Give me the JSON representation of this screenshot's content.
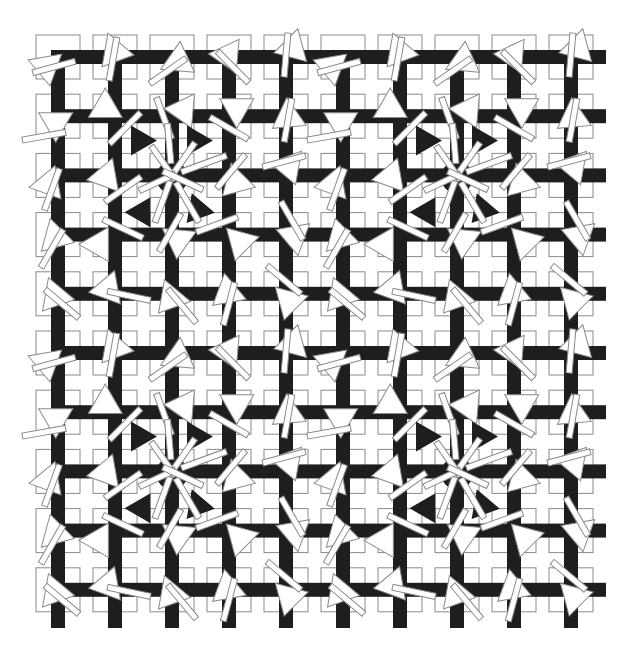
{
  "artwork": {
    "background": "#ffffff",
    "ink": "#1e1e1e",
    "outline": "#8a8a8a",
    "grid": {
      "cols": 10,
      "rows": 10,
      "origin_x": 36,
      "origin_y": 35,
      "pitch_x": 57,
      "pitch_y": 59.2,
      "square_size": 44,
      "bar_width": 14,
      "stub_right_to": 606,
      "stub_bottom_to": 628
    },
    "tile_period": 5,
    "tile": [
      [
        {
          "tri": 200,
          "tdx": -16,
          "tdy": 8,
          "bar": -15,
          "bdx": -4,
          "bdy": 10,
          "circle": false
        },
        {
          "tri": 250,
          "tdx": -2,
          "tdy": -10,
          "bar": -80,
          "bdx": -2,
          "bdy": 2,
          "circle": false
        },
        {
          "tri": 155,
          "tdx": 2,
          "tdy": 6,
          "bar": -35,
          "bdx": -4,
          "bdy": 14,
          "circle": false
        },
        {
          "tri": 185,
          "tdx": -6,
          "tdy": -2,
          "bar": 45,
          "bdx": 4,
          "bdy": 10,
          "circle": false
        },
        {
          "tri": 285,
          "tdx": 8,
          "tdy": -14,
          "bar": -85,
          "bdx": 0,
          "bdy": -2,
          "circle": false
        }
      ],
      [
        {
          "tri": 330,
          "tdx": 2,
          "tdy": 4,
          "bar": -10,
          "bdx": -14,
          "bdy": 20,
          "circle": false
        },
        {
          "tri": 150,
          "tdx": -14,
          "tdy": -6,
          "bar": -45,
          "bdx": 10,
          "bdy": 12,
          "circle": true
        },
        {
          "tri": 305,
          "tdx": 14,
          "tdy": -10,
          "bar": 70,
          "bdx": -8,
          "bdy": 2,
          "circle": true
        },
        {
          "tri": 330,
          "tdx": 12,
          "tdy": -10,
          "bar": 30,
          "bdx": 0,
          "bdy": 12,
          "circle": true
        },
        {
          "tri": 265,
          "tdx": 2,
          "tdy": -4,
          "bar": -80,
          "bdx": 2,
          "bdy": 4,
          "circle": false
        }
      ],
      [
        {
          "tri": 290,
          "tdx": -8,
          "tdy": 4,
          "bar": -70,
          "bdx": -6,
          "bdy": 14,
          "circle": false
        },
        {
          "tri": 170,
          "tdx": -14,
          "tdy": 2,
          "bar": -35,
          "bdx": 8,
          "bdy": 14,
          "circle": true
        },
        {
          "tri": 0,
          "tdx": 0,
          "tdy": 0,
          "bar": 0,
          "bdx": 0,
          "bdy": 0,
          "circle": false,
          "cluster": true
        },
        {
          "tri": 15,
          "tdx": 12,
          "tdy": 8,
          "bar": -50,
          "bdx": 2,
          "bdy": -4,
          "circle": true
        },
        {
          "tri": 190,
          "tdx": -2,
          "tdy": -10,
          "bar": -15,
          "bdx": -2,
          "bdy": -14,
          "circle": false
        }
      ],
      [
        {
          "tri": 15,
          "tdx": 2,
          "tdy": 4,
          "bar": -60,
          "bdx": -6,
          "bdy": 14,
          "circle": false
        },
        {
          "tri": 60,
          "tdx": -14,
          "tdy": 14,
          "bar": 25,
          "bdx": 8,
          "bdy": -6,
          "circle": true
        },
        {
          "tri": 95,
          "tdx": 6,
          "tdy": 10,
          "bar": -60,
          "bdx": -2,
          "bdy": -2,
          "circle": true
        },
        {
          "tri": 345,
          "tdx": 16,
          "tdy": 6,
          "bar": -20,
          "bdx": -12,
          "bdy": -10,
          "circle": true
        },
        {
          "tri": 200,
          "tdx": 4,
          "tdy": 0,
          "bar": 60,
          "bdx": 6,
          "bdy": -14,
          "circle": false
        }
      ],
      [
        {
          "tri": 130,
          "tdx": -6,
          "tdy": 6,
          "bar": 40,
          "bdx": 4,
          "bdy": 10,
          "circle": false
        },
        {
          "tri": 170,
          "tdx": -12,
          "tdy": -4,
          "bar": 12,
          "bdx": 14,
          "bdy": 2,
          "circle": false
        },
        {
          "tri": 130,
          "tdx": -4,
          "tdy": 8,
          "bar": 50,
          "bdx": 10,
          "bdy": 12,
          "circle": false
        },
        {
          "tri": 260,
          "tdx": -2,
          "tdy": -6,
          "bar": -75,
          "bdx": 0,
          "bdy": 10,
          "circle": false
        },
        {
          "tri": 345,
          "tdx": 8,
          "tdy": 6,
          "bar": 40,
          "bdx": -2,
          "bdy": -14,
          "circle": false
        }
      ]
    ],
    "cluster": {
      "circle_radius": 16,
      "triangle_size": 30,
      "triangles": [
        {
          "dx": -28,
          "dy": -35,
          "rot": 0
        },
        {
          "dx": 28,
          "dy": -35,
          "rot": 0
        },
        {
          "dx": -28,
          "dy": 33,
          "rot": -60
        },
        {
          "dx": 30,
          "dy": 35,
          "rot": 10
        }
      ],
      "bars": [
        {
          "angle": -55,
          "len": 46,
          "off": -6
        },
        {
          "angle": -125,
          "len": 42,
          "off": -6
        },
        {
          "angle": 60,
          "len": 46,
          "off": 8
        },
        {
          "angle": 110,
          "len": 44,
          "off": 6
        },
        {
          "angle": -20,
          "len": 48,
          "off": 10
        },
        {
          "angle": 155,
          "len": 40,
          "off": -4
        },
        {
          "angle": -95,
          "len": 40,
          "off": 12
        },
        {
          "angle": 25,
          "len": 44,
          "off": -10
        }
      ]
    }
  }
}
